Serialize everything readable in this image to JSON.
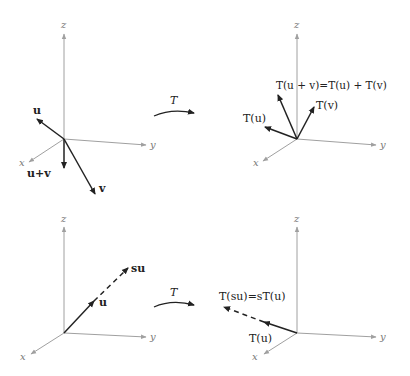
{
  "figure": {
    "map_label": "T",
    "colors": {
      "axis": "#a0a0a0",
      "vector": "#222222",
      "background": "#ffffff"
    }
  },
  "panels": [
    {
      "id": "additivity-domain",
      "axes": {
        "x": "x",
        "y": "y",
        "z": "z"
      },
      "vectors": [
        {
          "label": "u",
          "style": "solid"
        },
        {
          "label": "u+v",
          "style": "solid"
        },
        {
          "label": "v",
          "style": "solid"
        }
      ]
    },
    {
      "id": "additivity-codomain",
      "axes": {
        "x": "x",
        "y": "y",
        "z": "z"
      },
      "vectors": [
        {
          "label": "T(u)",
          "style": "solid"
        },
        {
          "label": "T(u + v)=T(u) + T(v)",
          "style": "solid"
        },
        {
          "label": "T(v)",
          "style": "solid"
        }
      ]
    },
    {
      "id": "homogeneity-domain",
      "axes": {
        "x": "x",
        "y": "y",
        "z": "z"
      },
      "vectors": [
        {
          "label": "u",
          "style": "solid"
        },
        {
          "label": "su",
          "style": "dashed"
        }
      ]
    },
    {
      "id": "homogeneity-codomain",
      "axes": {
        "x": "x",
        "y": "y",
        "z": "z"
      },
      "vectors": [
        {
          "label": "T(u)",
          "style": "solid"
        },
        {
          "label": "T(su)=sT(u)",
          "style": "dashed"
        }
      ]
    }
  ]
}
